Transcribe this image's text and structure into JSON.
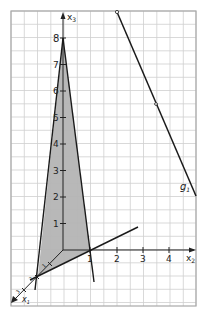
{
  "diagram": {
    "type": "3d-coordinate-system",
    "axes": {
      "x1_label": "x",
      "x1_sub": "1",
      "x2_label": "x",
      "x2_sub": "2",
      "x3_label": "x",
      "x3_sub": "3"
    },
    "x2_ticks": [
      "1",
      "2",
      "3",
      "4"
    ],
    "x3_ticks": [
      "1",
      "2",
      "3",
      "4",
      "5",
      "6",
      "7",
      "8"
    ],
    "x1_ticks": [
      "1",
      "2",
      "3"
    ],
    "line_label": "g",
    "line_sub": "1",
    "colors": {
      "grid": "#c8c8c8",
      "plane_fill": "#b4b4b4",
      "line": "#1a1a1a",
      "background": "#ffffff"
    }
  }
}
